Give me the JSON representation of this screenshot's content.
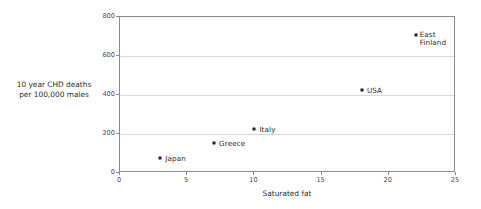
{
  "chart_data": {
    "type": "scatter",
    "title": "",
    "xlabel": "Saturated fat",
    "ylabel": "10 year CHD deaths\nper 100,000 males",
    "xlim": [
      0,
      25
    ],
    "ylim": [
      0,
      800
    ],
    "xticks": [
      "0",
      "5",
      "10",
      "15",
      "20",
      "25"
    ],
    "xtick_values": [
      0,
      5,
      10,
      15,
      20,
      25
    ],
    "yticks": [
      "0",
      "200",
      "400",
      "600",
      "800"
    ],
    "ytick_values": [
      0,
      200,
      400,
      600,
      800
    ],
    "grid": "horizontal",
    "legend": "none",
    "marker_color": "#1f1f1f",
    "frame_color": "#8a8a8a",
    "grid_color": "#d8d8d8",
    "points": [
      {
        "label": "Japan",
        "x": 3,
        "y": 75,
        "label_offset_x": 5,
        "label_offset_y": -3
      },
      {
        "label": "Greece",
        "x": 7,
        "y": 155,
        "label_offset_x": 5,
        "label_offset_y": -3
      },
      {
        "label": "Italy",
        "x": 10,
        "y": 225,
        "label_offset_x": 5,
        "label_offset_y": -3
      },
      {
        "label": "USA",
        "x": 18,
        "y": 425,
        "label_offset_x": 5,
        "label_offset_y": -3
      },
      {
        "label": "East\nFinland",
        "x": 22,
        "y": 710,
        "label_offset_x": 4,
        "label_offset_y": -4
      }
    ]
  }
}
